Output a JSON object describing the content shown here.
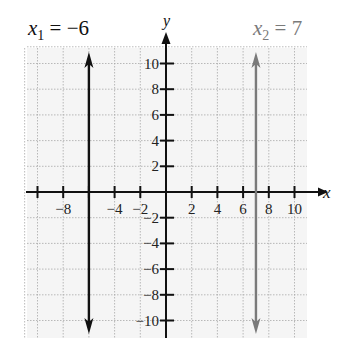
{
  "chart_data": {
    "type": "line",
    "title": "",
    "xlabel": "x",
    "ylabel": "y",
    "xlim": [
      -11,
      11
    ],
    "ylim": [
      -11,
      11
    ],
    "grid": true,
    "x_ticks": [
      -8,
      -4,
      -2,
      2,
      4,
      6,
      8,
      10
    ],
    "x_tick_labels": [
      "−8",
      "−4",
      "−2",
      "2",
      "4",
      "6",
      "8",
      "10"
    ],
    "y_ticks": [
      10,
      8,
      6,
      4,
      2,
      -2,
      -4,
      -6,
      -8,
      -10
    ],
    "y_tick_labels": [
      "10",
      "8",
      "6",
      "4",
      "2",
      "−2",
      "−4",
      "−6",
      "−8",
      "−10"
    ],
    "series": [
      {
        "name": "x1 = −6",
        "type": "vertical_line",
        "x": -6,
        "color": "#111111"
      },
      {
        "name": "x2 = 7",
        "type": "vertical_line",
        "x": 7,
        "color": "#7a7a7a"
      }
    ],
    "annotations": [
      {
        "text_main": "x",
        "text_sub": "1",
        "text_rest": " = −6",
        "color": "#111111"
      },
      {
        "text_main": "x",
        "text_sub": "2",
        "text_rest": " = 7",
        "color": "#7a7a7a"
      }
    ]
  }
}
